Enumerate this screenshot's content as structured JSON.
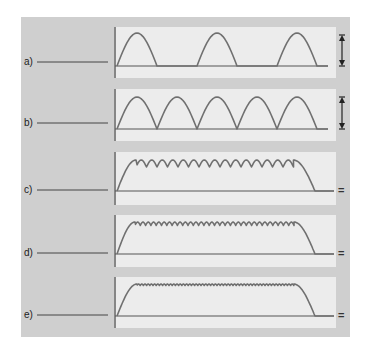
{
  "figure": {
    "colors": {
      "outer_panel": "#cfcfcf",
      "inner_panel": "#ececec",
      "axis": "#555555",
      "wave": "#707070"
    },
    "rows": [
      {
        "id": "a",
        "label": "a)",
        "waveform": "half-wave rectified",
        "right_marker": "double-arrow",
        "right_marker_text": ""
      },
      {
        "id": "b",
        "label": "b)",
        "waveform": "full-wave rectified",
        "right_marker": "double-arrow",
        "right_marker_text": ""
      },
      {
        "id": "c",
        "label": "c)",
        "waveform": "rectified with large ripple",
        "right_marker": "equals",
        "right_marker_text": "="
      },
      {
        "id": "d",
        "label": "d)",
        "waveform": "rectified with small ripple",
        "right_marker": "equals",
        "right_marker_text": "="
      },
      {
        "id": "e",
        "label": "e)",
        "waveform": "smoothed DC with minimal ripple",
        "right_marker": "equals",
        "right_marker_text": "="
      }
    ]
  }
}
